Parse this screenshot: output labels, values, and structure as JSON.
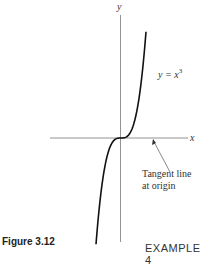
{
  "figure": {
    "caption": "Figure 3.12",
    "axis_x_label": "x",
    "axis_y_label": "y",
    "curve_label": "y = x",
    "curve_label_exponent": "3",
    "annotation_line1": "Tangent line",
    "annotation_line2": "at origin",
    "function": "x^3"
  },
  "footer": {
    "example_label": "EXAMPLE 4"
  }
}
